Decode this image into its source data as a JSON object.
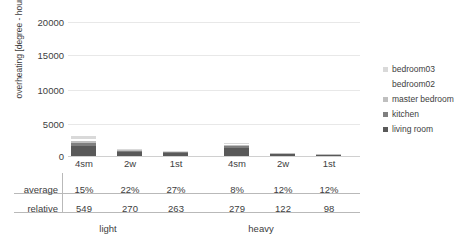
{
  "chart_data": {
    "type": "bar",
    "title": "",
    "xlabel": "",
    "ylabel": "overheating [degree - hours]",
    "ylim": [
      0,
      20000
    ],
    "yticks": [
      0,
      5000,
      10000,
      15000,
      20000
    ],
    "ytick_labels": [
      "0",
      "5000",
      "10000",
      "15000",
      "20000"
    ],
    "grid": true,
    "stacked": true,
    "legend_position": "right",
    "groups": [
      "light",
      "heavy"
    ],
    "categories": [
      "4sm",
      "2w",
      "1st",
      "4sm",
      "2w",
      "1st"
    ],
    "series": [
      {
        "name": "living room",
        "color": "#595959",
        "values": [
          1480,
          620,
          440,
          1180,
          300,
          170
        ]
      },
      {
        "name": "kitchen",
        "color": "#7f7f7f",
        "values": [
          420,
          130,
          90,
          280,
          70,
          40
        ]
      },
      {
        "name": "master bedroom",
        "color": "#bfbfbf",
        "values": [
          380,
          110,
          70,
          190,
          50,
          30
        ]
      },
      {
        "name": "bedroom02",
        "color": "#ffffff",
        "values": [
          320,
          90,
          60,
          150,
          40,
          25
        ]
      },
      {
        "name": "bedroom03",
        "color": "#d9d9d9",
        "values": [
          400,
          100,
          70,
          170,
          45,
          25
        ]
      }
    ],
    "legend_entries": [
      "bedroom03",
      "bedroom02",
      "master bedroom",
      "kitchen",
      "living room"
    ],
    "legend_swatch_colors": [
      "#d9d9d9",
      "#ffffff",
      "#bfbfbf",
      "#7f7f7f",
      "#595959"
    ]
  },
  "axis": {
    "y_label": "overheating [degree - hours]",
    "ticks": [
      "20000",
      "15000",
      "10000",
      "5000",
      "0"
    ],
    "x_labels": [
      "4sm",
      "2w",
      "1st",
      "4sm",
      "2w",
      "1st"
    ]
  },
  "legend": {
    "items": [
      {
        "label": "bedroom03",
        "color": "#d9d9d9"
      },
      {
        "label": "bedroom02",
        "color": "#ffffff"
      },
      {
        "label": "master bedroom",
        "color": "#bfbfbf"
      },
      {
        "label": "kitchen",
        "color": "#7f7f7f"
      },
      {
        "label": "living room",
        "color": "#595959"
      }
    ]
  },
  "table": {
    "row_labels": [
      "average",
      "relative"
    ],
    "rows": {
      "average": [
        "15%",
        "22%",
        "27%",
        "8%",
        "12%",
        "12%"
      ],
      "relative": [
        "549",
        "270",
        "263",
        "279",
        "122",
        "98"
      ]
    },
    "group_labels": [
      "light",
      "heavy"
    ]
  }
}
